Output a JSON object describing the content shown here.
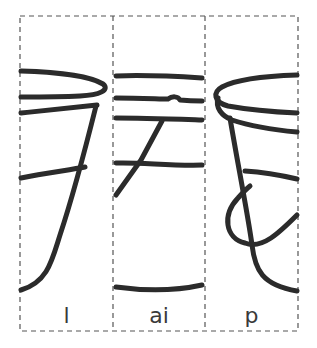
{
  "worksheet": {
    "title": "Cut-apart picture puzzle: bucket / pail",
    "colors": {
      "stroke": "#2b2b2b",
      "dash": "#555555",
      "background": "#ffffff"
    },
    "panels": [
      {
        "id": "panel-1",
        "label": "l",
        "content": "left part of pail: rim and left side with handle line"
      },
      {
        "id": "panel-2",
        "label": "ai",
        "content": "middle part of pail: horizontal bands, diagonal handle, bottom curve"
      },
      {
        "id": "panel-3",
        "label": "p",
        "content": "right part of pail: rim, right side and looping handle"
      }
    ]
  }
}
